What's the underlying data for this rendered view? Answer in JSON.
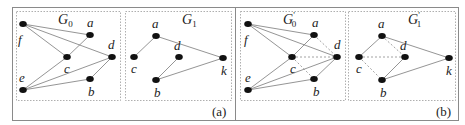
{
  "panels": [
    {
      "caption": "(a)",
      "graphs": [
        {
          "name": "G",
          "sub": "0",
          "prime": false,
          "nodes": [
            {
              "id": "f",
              "x": 23,
              "y": 24,
              "lx": 18,
              "ly": 44
            },
            {
              "id": "a",
              "x": 90,
              "y": 35,
              "lx": 87,
              "ly": 27
            },
            {
              "id": "c",
              "x": 67,
              "y": 57,
              "lx": 64,
              "ly": 73
            },
            {
              "id": "d",
              "x": 112,
              "y": 57,
              "lx": 108,
              "ly": 49
            },
            {
              "id": "e",
              "x": 23,
              "y": 90,
              "lx": 19,
              "ly": 82
            },
            {
              "id": "b",
              "x": 90,
              "y": 79,
              "lx": 88,
              "ly": 96
            }
          ],
          "edges": [
            [
              "f",
              "a"
            ],
            [
              "f",
              "c"
            ],
            [
              "f",
              "d"
            ],
            [
              "a",
              "c"
            ],
            [
              "c",
              "e"
            ],
            [
              "e",
              "d"
            ],
            [
              "e",
              "b"
            ],
            [
              "b",
              "d"
            ]
          ],
          "dashed_edges": []
        },
        {
          "name": "G",
          "sub": "1",
          "prime": false,
          "nodes": [
            {
              "id": "a",
              "x": 156,
              "y": 36,
              "lx": 152,
              "ly": 28
            },
            {
              "id": "c",
              "x": 134,
              "y": 57,
              "lx": 131,
              "ly": 73
            },
            {
              "id": "d",
              "x": 179,
              "y": 57,
              "lx": 174,
              "ly": 50
            },
            {
              "id": "k",
              "x": 223,
              "y": 58,
              "lx": 221,
              "ly": 75
            },
            {
              "id": "b",
              "x": 156,
              "y": 80,
              "lx": 154,
              "ly": 97
            }
          ],
          "edges": [
            [
              "a",
              "c"
            ],
            [
              "a",
              "k"
            ],
            [
              "d",
              "b"
            ],
            [
              "b",
              "k"
            ]
          ],
          "dashed_edges": []
        }
      ]
    },
    {
      "caption": "(b)",
      "graphs": [
        {
          "name": "G",
          "sub": "0",
          "prime": true,
          "nodes": [
            {
              "id": "f",
              "x": 248,
              "y": 24,
              "lx": 244,
              "ly": 44
            },
            {
              "id": "a",
              "x": 314,
              "y": 35,
              "lx": 312,
              "ly": 27
            },
            {
              "id": "c",
              "x": 292,
              "y": 57,
              "lx": 290,
              "ly": 73
            },
            {
              "id": "d",
              "x": 337,
              "y": 57,
              "lx": 334,
              "ly": 49
            },
            {
              "id": "e",
              "x": 248,
              "y": 90,
              "lx": 245,
              "ly": 82
            },
            {
              "id": "b",
              "x": 314,
              "y": 79,
              "lx": 313,
              "ly": 96
            }
          ],
          "edges": [
            [
              "f",
              "a"
            ],
            [
              "f",
              "c"
            ],
            [
              "f",
              "d"
            ],
            [
              "a",
              "c"
            ],
            [
              "c",
              "e"
            ],
            [
              "e",
              "d"
            ],
            [
              "e",
              "b"
            ],
            [
              "b",
              "d"
            ]
          ],
          "dashed_edges": [
            [
              "a",
              "d"
            ],
            [
              "c",
              "d"
            ],
            [
              "c",
              "b"
            ]
          ]
        },
        {
          "name": "G",
          "sub": "1",
          "prime": true,
          "nodes": [
            {
              "id": "a",
              "x": 382,
              "y": 36,
              "lx": 378,
              "ly": 28
            },
            {
              "id": "c",
              "x": 359,
              "y": 57,
              "lx": 356,
              "ly": 73
            },
            {
              "id": "d",
              "x": 405,
              "y": 57,
              "lx": 400,
              "ly": 50
            },
            {
              "id": "k",
              "x": 449,
              "y": 58,
              "lx": 446,
              "ly": 75
            },
            {
              "id": "b",
              "x": 382,
              "y": 80,
              "lx": 380,
              "ly": 97
            }
          ],
          "edges": [
            [
              "a",
              "c"
            ],
            [
              "a",
              "k"
            ],
            [
              "d",
              "b"
            ],
            [
              "b",
              "k"
            ]
          ],
          "dashed_edges": [
            [
              "a",
              "d"
            ],
            [
              "c",
              "d"
            ],
            [
              "c",
              "b"
            ]
          ]
        }
      ]
    }
  ],
  "layout": {
    "outer_boxes": [
      {
        "x": 12,
        "y": 7,
        "w": 223,
        "h": 113
      },
      {
        "x": 235,
        "y": 7,
        "w": 223,
        "h": 113
      }
    ],
    "inner_boxes": [
      {
        "x": 16,
        "y": 11,
        "w": 104,
        "h": 89,
        "title_x": 58,
        "title_y": 24
      },
      {
        "x": 125,
        "y": 11,
        "w": 106,
        "h": 89,
        "title_x": 182,
        "title_y": 24
      },
      {
        "x": 240,
        "y": 11,
        "w": 105,
        "h": 89,
        "title_x": 283,
        "title_y": 24
      },
      {
        "x": 348,
        "y": 11,
        "w": 107,
        "h": 89,
        "title_x": 408,
        "title_y": 24
      }
    ],
    "captions": [
      {
        "x": 212,
        "y": 116
      },
      {
        "x": 436,
        "y": 116
      }
    ]
  }
}
